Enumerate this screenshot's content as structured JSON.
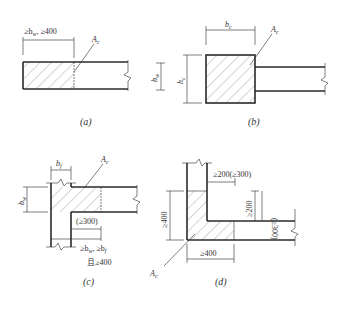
{
  "diagram": {
    "type": "structural-detail",
    "panels": [
      {
        "id": "a",
        "caption": "(a)",
        "area_label": "A_c",
        "dims": {
          "top": "≥b_w, ≥400",
          "right": "b_w"
        },
        "shape": "rectangular wall end"
      },
      {
        "id": "b",
        "caption": "(b)",
        "area_label": "A_c",
        "dims": {
          "top": "b_c",
          "left": "h_c"
        },
        "shape": "end column"
      },
      {
        "id": "c",
        "caption": "(c)",
        "area_label": "A_c",
        "dims": {
          "top": "b_f",
          "left": "b_w",
          "inner": "(≥300)",
          "bottom_line1": "≥b_w, ≥b_f",
          "bottom_line2": "且≥400"
        },
        "shape": "flanged T-wall"
      },
      {
        "id": "d",
        "caption": "(d)",
        "area_label": "A_c",
        "dims": {
          "top": "≥200(≥300)",
          "left": "≥400",
          "right_a": "≥200",
          "right_b": "(≥300)",
          "bottom": "≥400"
        },
        "shape": "corner L-wall"
      }
    ]
  },
  "labels": {
    "a_caption": "(a)",
    "b_caption": "(b)",
    "c_caption": "(c)",
    "d_caption": "(d)",
    "ac": "A",
    "ac_sub": "c",
    "a_top": "≥b",
    "a_top_sub": "w",
    "a_top_rest": ", ≥400",
    "a_right": "b",
    "a_right_sub": "w",
    "b_top": "b",
    "b_top_sub": "c",
    "b_left": "h",
    "b_left_sub": "c",
    "c_top": "b",
    "c_top_sub": "f",
    "c_left": "b",
    "c_left_sub": "w",
    "c_inner": "(≥300)",
    "c_bottom1": "≥b",
    "c_bottom1_sub": "w",
    "c_bottom1_mid": ", ≥b",
    "c_bottom1_sub2": "f",
    "c_bottom2": "且≥400",
    "d_top": "≥200(≥300)",
    "d_left": "≥400",
    "d_right_a": "≥200",
    "d_right_b": "(≥300)",
    "d_bottom": "≥400"
  }
}
